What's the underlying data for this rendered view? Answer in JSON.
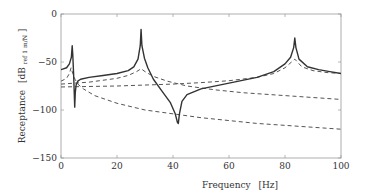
{
  "chart_data": {
    "type": "line",
    "title": "",
    "xlabel": "Frequency",
    "xlabel_unit": "[Hz]",
    "ylabel": "Receptance",
    "ylabel_unit_main": "[dB",
    "ylabel_unit_sub": "ref 1 m/N",
    "ylabel_unit_close": "]",
    "xlim": [
      0,
      100
    ],
    "ylim": [
      -150,
      0
    ],
    "xticks": [
      0,
      20,
      40,
      60,
      80,
      100
    ],
    "yticks": [
      0,
      -50,
      -100,
      -150
    ],
    "grid": false,
    "legend": null,
    "series": [
      {
        "name": "total receptance",
        "style": "solid",
        "color": "#333333",
        "x": [
          0,
          2,
          3,
          3.7,
          4.0,
          4.2,
          4.5,
          4.9,
          5.1,
          5.4,
          6,
          7,
          10,
          15,
          20,
          24,
          26,
          27.5,
          28.3,
          28.6,
          28.9,
          29.8,
          31,
          33,
          36,
          39,
          40.8,
          41.6,
          41.9,
          42.3,
          43.2,
          45,
          50,
          60,
          70,
          76,
          80,
          82,
          83.1,
          83.5,
          83.9,
          85,
          88,
          92,
          96,
          100
        ],
        "y": [
          -58,
          -56,
          -52,
          -45,
          -33,
          -42,
          -62,
          -97,
          -82,
          -74,
          -70,
          -68,
          -66,
          -64,
          -62,
          -59,
          -55,
          -47,
          -33,
          -16,
          -33,
          -46,
          -56,
          -68,
          -80,
          -92,
          -104,
          -113,
          -114,
          -104,
          -91,
          -84,
          -78,
          -72,
          -66,
          -60,
          -52,
          -45,
          -35,
          -25,
          -35,
          -47,
          -55,
          -58,
          -60,
          -62
        ]
      },
      {
        "name": "mode 1 contribution",
        "style": "dashed",
        "color": "#555555",
        "x": [
          0,
          2,
          3,
          3.6,
          4.2,
          5,
          6,
          8,
          12,
          20,
          30,
          40,
          50,
          60,
          70,
          80,
          90,
          100
        ],
        "y": [
          -70,
          -67,
          -62,
          -56,
          -62,
          -68,
          -73,
          -78,
          -85,
          -93,
          -100,
          -104,
          -108,
          -111,
          -114,
          -116,
          -118,
          -120
        ]
      },
      {
        "name": "mode 2 contribution",
        "style": "dashed",
        "color": "#555555",
        "x": [
          0,
          5,
          10,
          15,
          20,
          24,
          27,
          28.6,
          30,
          33,
          38,
          45,
          55,
          65,
          75,
          85,
          100
        ],
        "y": [
          -73,
          -72,
          -71,
          -69,
          -67,
          -64,
          -60,
          -57,
          -60,
          -65,
          -70,
          -75,
          -79,
          -82,
          -84,
          -86,
          -89
        ]
      },
      {
        "name": "mode 3 contribution",
        "style": "dashed",
        "color": "#555555",
        "x": [
          0,
          10,
          20,
          30,
          40,
          50,
          60,
          70,
          76,
          80,
          83.5,
          86,
          90,
          95,
          100
        ],
        "y": [
          -76,
          -75.5,
          -75,
          -74,
          -73,
          -71.5,
          -69.5,
          -66,
          -62,
          -56,
          -47,
          -55,
          -59,
          -61,
          -62
        ]
      }
    ]
  },
  "layout": {
    "plot_left": 61,
    "plot_right": 341,
    "plot_top": 14,
    "plot_bottom": 158
  }
}
